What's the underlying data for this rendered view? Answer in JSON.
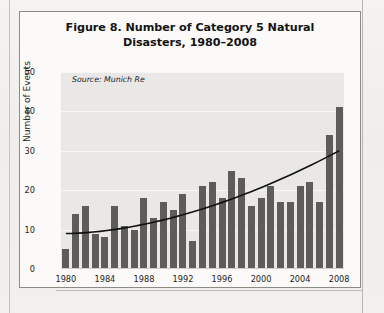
{
  "figure": {
    "title": "Figure 8. Number of Category 5 Natural Disasters, 1980–2008",
    "source_note": "Source: Munich Re"
  },
  "chart_data": {
    "type": "bar",
    "title": "Figure 8. Number of Category 5 Natural Disasters, 1980–2008",
    "xlabel": "",
    "ylabel": "Number of Events",
    "ylim": [
      0,
      50
    ],
    "yticks": [
      0,
      10,
      20,
      30,
      40,
      50
    ],
    "xtick_labels": [
      "1980",
      "1984",
      "1988",
      "1992",
      "1996",
      "2000",
      "2004",
      "2008"
    ],
    "grid": true,
    "legend": "none",
    "bar_color": "#5d5c5a",
    "plot_background": "#e9e8e6",
    "annotations": [
      "Source: Munich Re"
    ],
    "categories": [
      "1980",
      "1981",
      "1982",
      "1983",
      "1984",
      "1985",
      "1986",
      "1987",
      "1988",
      "1989",
      "1990",
      "1991",
      "1992",
      "1993",
      "1994",
      "1995",
      "1996",
      "1997",
      "1998",
      "1999",
      "2000",
      "2001",
      "2002",
      "2003",
      "2004",
      "2005",
      "2006",
      "2007",
      "2008"
    ],
    "values": [
      5,
      14,
      16,
      9,
      8,
      16,
      11,
      10,
      18,
      13,
      17,
      15,
      19,
      7,
      21,
      22,
      18,
      25,
      23,
      16,
      18,
      21,
      17,
      17,
      21,
      22,
      17,
      34,
      41
    ],
    "series": [
      {
        "name": "Number of Events",
        "type": "bar",
        "values": [
          5,
          14,
          16,
          9,
          8,
          16,
          11,
          10,
          18,
          13,
          17,
          15,
          19,
          7,
          21,
          22,
          18,
          25,
          23,
          16,
          18,
          21,
          17,
          17,
          21,
          22,
          17,
          34,
          41
        ]
      },
      {
        "name": "Trend",
        "type": "line",
        "color": "#111111",
        "x": [
          "1980",
          "2008"
        ],
        "values": [
          9,
          30
        ]
      }
    ]
  }
}
